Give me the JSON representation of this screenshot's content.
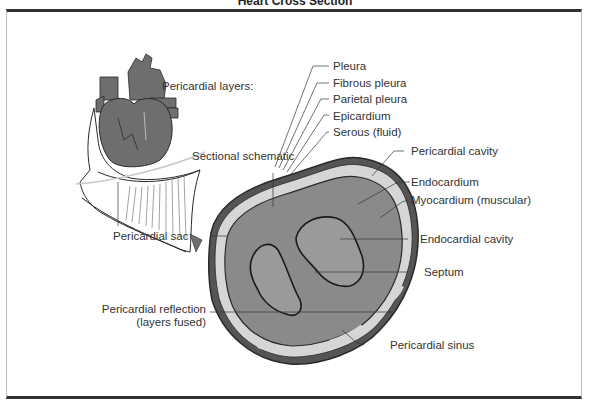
{
  "title": "Heart Cross Section",
  "labels": {
    "pericardial_layers": "Pericardial layers:",
    "pleura": "Pleura",
    "fibrous_pleura": "Fibrous pleura",
    "parietal_pleura": "Parietal pleura",
    "epicardium": "Epicardium",
    "serous_fluid": "Serous (fluid)",
    "pericardial_cavity": "Pericardial cavity",
    "endocardium": "Endocardium",
    "myocardium": "Myocardium (muscular)",
    "endocardial_cavity": "Endocardial cavity",
    "septum": "Septum",
    "sectional_schematic": "Sectional schematic",
    "pericardial_sac": "Pericardial sac",
    "pericardial_reflection_line1": "Pericardial reflection",
    "pericardial_reflection_line2": "(layers fused)",
    "pericardial_sinus": "Pericardial sinus"
  },
  "colors": {
    "heart_fill": "#6e6e6e",
    "section_fill": "#8a8a8a",
    "cavity_fill": "#9a9a9a",
    "fluid_layer": "#d6d6d6",
    "outline": "#2a2a2a",
    "frame_border": "#333333"
  }
}
